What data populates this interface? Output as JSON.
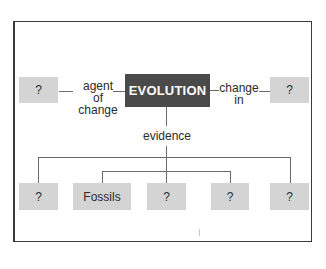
{
  "diagram": {
    "type": "concept-map",
    "center": {
      "label": "EVOLUTION",
      "color": "#4a4a4a",
      "text_color": "#ffffff"
    },
    "left": {
      "link_label_line1": "agent",
      "link_label_line2": "of change",
      "node": "?"
    },
    "right": {
      "link_label_line1": "change",
      "link_label_line2": "in",
      "node": "?"
    },
    "down": {
      "link_label": "evidence",
      "nodes": [
        "?",
        "Fossils",
        "?",
        "?",
        "?"
      ]
    },
    "box_color": "#d4d4d4",
    "line_color": "#6a6a6a"
  }
}
